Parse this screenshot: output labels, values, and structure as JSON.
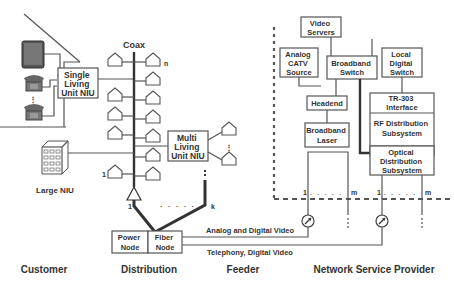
{
  "labels": {
    "coax": "Coax",
    "single_niu": [
      "Single",
      "Living",
      "Unit NIU"
    ],
    "multi_niu": [
      "Multi",
      "Living",
      "Unit NIU"
    ],
    "large_niu": "Large NIU",
    "power_node": [
      "Power",
      "Node"
    ],
    "fiber_node": [
      "Fiber",
      "Node"
    ],
    "analog_digital": "Analog and Digital Video",
    "telephony": "Telephony, Digital Video",
    "video_servers": [
      "Video",
      "Servers"
    ],
    "analog_catv": [
      "Analog",
      "CATV",
      "Source"
    ],
    "broadband_switch": [
      "Broadband",
      "Switch"
    ],
    "local_digital_switch": [
      "Local",
      "Digital",
      "Switch"
    ],
    "headend": "Headend",
    "broadband_laser": [
      "Broadband",
      "Laser"
    ],
    "tr303": [
      "TR-303",
      "Interface"
    ],
    "rf_dist": [
      "RF Distribution",
      "Subsystem"
    ],
    "optical_dist": [
      "Optical",
      "Distribution",
      "Subsystem"
    ],
    "n": "n",
    "one": "1",
    "k": "k",
    "m": "m",
    "dots": ". . . . ."
  },
  "sections": [
    "Customer",
    "Distribution",
    "Feeder",
    "Network Service Provider"
  ]
}
